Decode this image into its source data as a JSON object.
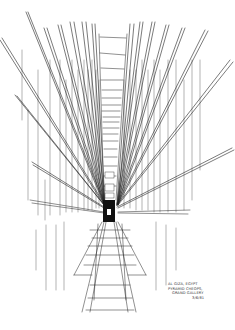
{
  "artwork": {
    "subject": "Grand Gallery, Pyramid of Cheops — perspective ink sketch",
    "ink_color": "#222222",
    "paper_color": "#ffffff"
  },
  "caption": {
    "line1": "Al Giza, Egypt",
    "line2": "Pyramid Cheops,",
    "line3": "Grand Gallery",
    "line4": "3/6/81"
  }
}
